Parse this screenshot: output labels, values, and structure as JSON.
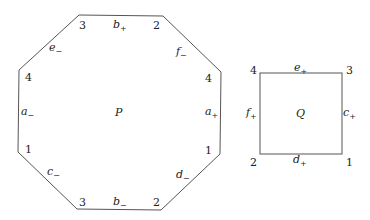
{
  "octagon": {
    "name": "P",
    "vertex_labels": {
      "top_left": "3",
      "top_right": "2",
      "right_top": "4",
      "right_bottom": "1",
      "bottom_right": "2",
      "bottom_left": "3",
      "left_bottom": "1",
      "left_top": "4"
    },
    "edges": {
      "top": {
        "base": "b",
        "sign": "+"
      },
      "top_right": {
        "base": "f",
        "sign": "−"
      },
      "right": {
        "base": "a",
        "sign": "+"
      },
      "bottom_right": {
        "base": "d",
        "sign": "−"
      },
      "bottom": {
        "base": "b",
        "sign": "−"
      },
      "bottom_left": {
        "base": "c",
        "sign": "−"
      },
      "left": {
        "base": "a",
        "sign": "−"
      },
      "top_left": {
        "base": "e",
        "sign": "−"
      }
    }
  },
  "square": {
    "name": "Q",
    "vertex_labels": {
      "top_left": "4",
      "top_right": "3",
      "bottom_right": "1",
      "bottom_left": "2"
    },
    "edges": {
      "top": {
        "base": "e",
        "sign": "+"
      },
      "right": {
        "base": "c",
        "sign": "+"
      },
      "bottom": {
        "base": "d",
        "sign": "+"
      },
      "left": {
        "base": "f",
        "sign": "+"
      }
    }
  },
  "colors": {
    "stroke": "#555555",
    "text": "#222222"
  }
}
